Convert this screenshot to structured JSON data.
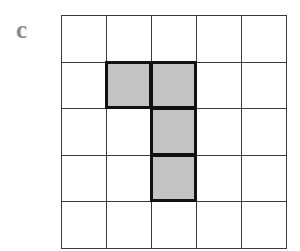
{
  "panel": {
    "label": "c"
  },
  "grid": {
    "rows": 5,
    "cols": 5,
    "shaded_cells": [
      {
        "row": 1,
        "col": 1
      },
      {
        "row": 1,
        "col": 2
      },
      {
        "row": 2,
        "col": 2
      },
      {
        "row": 3,
        "col": 2
      }
    ],
    "colors": {
      "shaded_fill": "#c3c3c3",
      "shaded_border": "#111111",
      "grid_line": "#3a3a3a",
      "background": "#ffffff",
      "label": "#8a8a8a"
    }
  }
}
